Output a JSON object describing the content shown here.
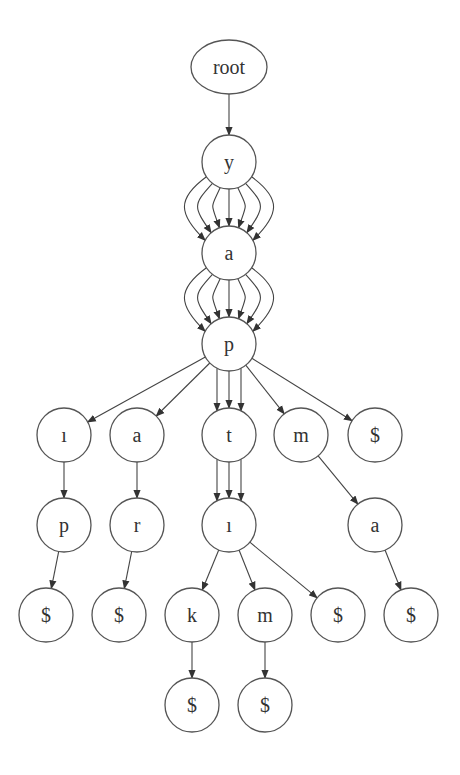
{
  "diagram": {
    "type": "trie",
    "colors": {
      "node_stroke": "#555555",
      "edge": "#444444",
      "label": "#333333",
      "background": "#ffffff"
    },
    "nodes": [
      {
        "id": "root",
        "label": "root",
        "x": 229,
        "y": 67,
        "shape": "ellipse",
        "rx": 38,
        "ry": 27
      },
      {
        "id": "y",
        "label": "y",
        "x": 229,
        "y": 162
      },
      {
        "id": "a1",
        "label": "a",
        "x": 229,
        "y": 253
      },
      {
        "id": "p1",
        "label": "p",
        "x": 229,
        "y": 344
      },
      {
        "id": "i1",
        "label": "ı",
        "x": 64,
        "y": 435
      },
      {
        "id": "a2",
        "label": "a",
        "x": 137,
        "y": 435
      },
      {
        "id": "t",
        "label": "t",
        "x": 229,
        "y": 435
      },
      {
        "id": "m1",
        "label": "m",
        "x": 301,
        "y": 435
      },
      {
        "id": "d1",
        "label": "$",
        "x": 375,
        "y": 435
      },
      {
        "id": "p2",
        "label": "p",
        "x": 64,
        "y": 525
      },
      {
        "id": "r",
        "label": "r",
        "x": 137,
        "y": 525
      },
      {
        "id": "i2",
        "label": "ı",
        "x": 229,
        "y": 525
      },
      {
        "id": "a3",
        "label": "a",
        "x": 375,
        "y": 525
      },
      {
        "id": "d2",
        "label": "$",
        "x": 46,
        "y": 615
      },
      {
        "id": "d3",
        "label": "$",
        "x": 119,
        "y": 615
      },
      {
        "id": "k",
        "label": "k",
        "x": 192,
        "y": 615
      },
      {
        "id": "m2",
        "label": "m",
        "x": 265,
        "y": 615
      },
      {
        "id": "d4",
        "label": "$",
        "x": 338,
        "y": 615
      },
      {
        "id": "d5",
        "label": "$",
        "x": 411,
        "y": 615
      },
      {
        "id": "d6",
        "label": "$",
        "x": 192,
        "y": 705
      },
      {
        "id": "d7",
        "label": "$",
        "x": 265,
        "y": 705
      }
    ],
    "edges": [
      {
        "from": "root",
        "to": "y",
        "count": 1
      },
      {
        "from": "y",
        "to": "a1",
        "count": 7
      },
      {
        "from": "a1",
        "to": "p1",
        "count": 7
      },
      {
        "from": "p1",
        "to": "i1",
        "count": 1
      },
      {
        "from": "p1",
        "to": "a2",
        "count": 1
      },
      {
        "from": "p1",
        "to": "t",
        "count": 3
      },
      {
        "from": "p1",
        "to": "m1",
        "count": 1
      },
      {
        "from": "p1",
        "to": "d1",
        "count": 1
      },
      {
        "from": "i1",
        "to": "p2",
        "count": 1
      },
      {
        "from": "a2",
        "to": "r",
        "count": 1
      },
      {
        "from": "t",
        "to": "i2",
        "count": 3
      },
      {
        "from": "m1",
        "to": "a3",
        "count": 1
      },
      {
        "from": "p2",
        "to": "d2",
        "count": 1
      },
      {
        "from": "r",
        "to": "d3",
        "count": 1
      },
      {
        "from": "i2",
        "to": "k",
        "count": 1
      },
      {
        "from": "i2",
        "to": "m2",
        "count": 1
      },
      {
        "from": "i2",
        "to": "d4",
        "count": 1
      },
      {
        "from": "a3",
        "to": "d5",
        "count": 1
      },
      {
        "from": "k",
        "to": "d6",
        "count": 1
      },
      {
        "from": "m2",
        "to": "d7",
        "count": 1
      }
    ],
    "node_radius": 27
  }
}
